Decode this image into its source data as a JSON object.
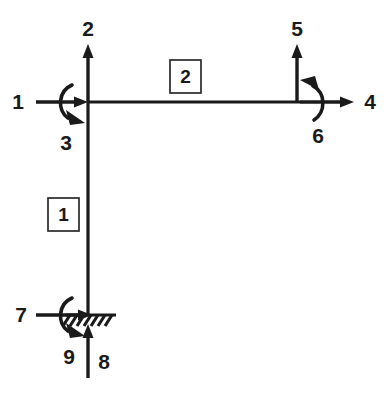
{
  "diagram": {
    "type": "structural-frame",
    "background_color": "#ffffff",
    "line_color": "#1a1a1a",
    "geometry": {
      "corner_joint": {
        "x": 88,
        "y": 102
      },
      "right_joint": {
        "x": 300,
        "y": 102
      },
      "base_joint": {
        "x": 88,
        "y": 316
      }
    },
    "members": [
      {
        "id": "member-1",
        "label": "1",
        "description": "vertical column",
        "label_box": {
          "x": 48,
          "y": 198,
          "width": 31,
          "height": 33
        }
      },
      {
        "id": "member-2",
        "label": "2",
        "description": "horizontal beam",
        "label_box": {
          "x": 170,
          "y": 60,
          "width": 31,
          "height": 33
        }
      }
    ],
    "degrees_of_freedom": [
      {
        "number": "1",
        "at": "corner-joint",
        "kind": "force",
        "direction": "horizontal-right",
        "label_x": 18,
        "label_y": 103
      },
      {
        "number": "2",
        "at": "corner-joint",
        "kind": "force",
        "direction": "vertical-up",
        "label_x": 88,
        "label_y": 30
      },
      {
        "number": "3",
        "at": "corner-joint",
        "kind": "moment",
        "direction": "clockwise",
        "label_x": 66,
        "label_y": 144
      },
      {
        "number": "4",
        "at": "right-joint",
        "kind": "force",
        "direction": "horizontal-right",
        "label_x": 370,
        "label_y": 103
      },
      {
        "number": "5",
        "at": "right-joint",
        "kind": "force",
        "direction": "vertical-up",
        "label_x": 297,
        "label_y": 30
      },
      {
        "number": "6",
        "at": "right-joint",
        "kind": "moment",
        "direction": "counterclockwise",
        "label_x": 318,
        "label_y": 137
      },
      {
        "number": "7",
        "at": "base-joint",
        "kind": "force",
        "direction": "horizontal-right",
        "label_x": 21,
        "label_y": 316
      },
      {
        "number": "8",
        "at": "base-joint",
        "kind": "force",
        "direction": "vertical-up",
        "label_x": 104,
        "label_y": 363
      },
      {
        "number": "9",
        "at": "base-joint",
        "kind": "moment",
        "direction": "clockwise",
        "label_x": 69,
        "label_y": 358
      }
    ],
    "support": {
      "type": "fixed",
      "location": "base-joint",
      "hatch_count": 7,
      "hatch_span": {
        "x_start": 68,
        "x_end": 114,
        "y": 316
      }
    }
  }
}
